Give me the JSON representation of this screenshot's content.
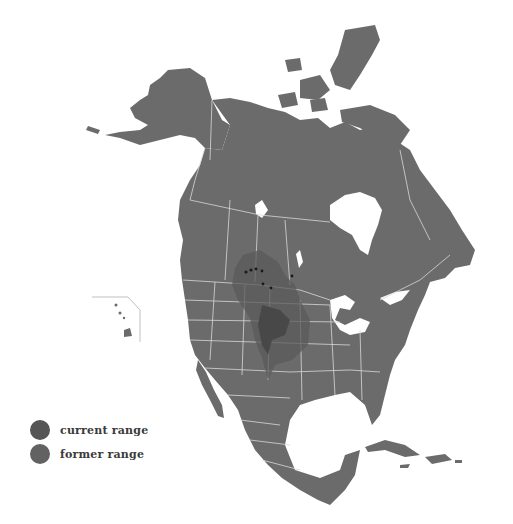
{
  "map": {
    "subject": "North America species range map",
    "colors": {
      "land": "#6b6b6b",
      "borders": "#d8d8d8",
      "water": "#ffffff",
      "former_range": "#5e5e5e",
      "current_range": "#4a4a4a",
      "occurrence_points": "#1a1a1a"
    },
    "insets": [
      "Hawaii"
    ]
  },
  "legend": {
    "items": [
      {
        "label": "current range",
        "color": "#555555"
      },
      {
        "label": "former range",
        "color": "#626262"
      }
    ]
  }
}
